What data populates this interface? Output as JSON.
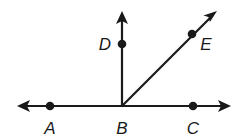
{
  "diagram": {
    "type": "geometry-rays-angles",
    "colors": {
      "stroke": "#1a1a1a",
      "background": "#ffffff"
    },
    "points": [
      {
        "id": "A",
        "label": "A",
        "x": 50,
        "y": 106,
        "label_x": 50,
        "label_y": 128
      },
      {
        "id": "B",
        "label": "B",
        "x": 122,
        "y": 106,
        "label_x": 122,
        "label_y": 128
      },
      {
        "id": "C",
        "label": "C",
        "x": 193,
        "y": 106,
        "label_x": 193,
        "label_y": 128
      },
      {
        "id": "D",
        "label": "D",
        "x": 122,
        "y": 44,
        "label_x": 105,
        "label_y": 50
      },
      {
        "id": "E",
        "label": "E",
        "x": 192,
        "y": 34,
        "label_x": 206,
        "label_y": 50
      }
    ],
    "line_AC": {
      "from": [
        18,
        106
      ],
      "to": [
        230,
        106
      ],
      "arrows": "both"
    },
    "ray_BD": {
      "from": [
        122,
        106
      ],
      "to": [
        122,
        12
      ],
      "arrows": "end"
    },
    "ray_BE": {
      "from": [
        122,
        106
      ],
      "to": [
        216,
        12
      ],
      "arrows": "end"
    }
  }
}
